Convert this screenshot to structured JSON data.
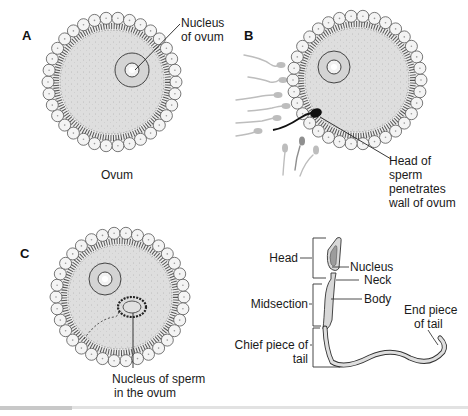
{
  "figure": {
    "panels": [
      {
        "id": "A",
        "letter": "A",
        "caption": "Ovum",
        "labels": [
          "Nucleus",
          "of ovum"
        ]
      },
      {
        "id": "B",
        "letter": "B",
        "labels": [
          "Head of",
          "sperm",
          "penetrates",
          "wall of ovum"
        ]
      },
      {
        "id": "C",
        "letter": "C",
        "labels": [
          "Nucleus of sperm",
          "in the ovum"
        ]
      }
    ],
    "sperm_anatomy": {
      "regions": {
        "head": "Head",
        "midsection": "Midsection",
        "chief_piece_line1": "Chief piece of",
        "chief_piece_line2": "tail"
      },
      "parts": {
        "nucleus": "Nucleus",
        "neck": "Neck",
        "body": "Body",
        "end_piece_line1": "End piece",
        "end_piece_line2": "of tail"
      }
    },
    "colors": {
      "cytoplasm": "#dcdcdc",
      "cell_fill": "#f3f3f3",
      "outline": "#3a3a3a",
      "sperm_faded": "#b8b8b8",
      "sperm_dark": "#111111"
    }
  }
}
